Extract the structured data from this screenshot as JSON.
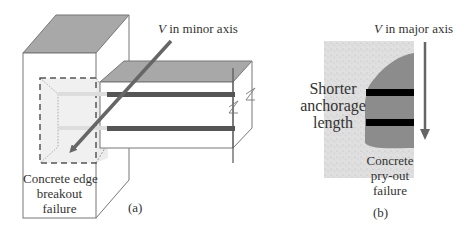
{
  "panel_a": {
    "axis_label_var": "V",
    "axis_label_rest": " in minor axis",
    "failure_label_lines": [
      "Concrete edge",
      "breakout",
      "failure"
    ],
    "caption": "(a)"
  },
  "panel_b": {
    "axis_label_var": "V",
    "axis_label_rest": " in major axis",
    "anchorage_label_lines": [
      "Shorter",
      "anchorage",
      "length"
    ],
    "failure_label_lines": [
      "Concrete",
      "pry-out",
      "failure"
    ],
    "caption": "(b)"
  },
  "colors": {
    "block_top": "#a8a8a8",
    "block_edge": "#666666",
    "rebar_dark": "#555555",
    "rebar_b": "#000000",
    "arrow": "#666666",
    "concrete_fill": "#dcdcdc",
    "failure_zone": "#8c8c8c",
    "breakout_fill": "#ececec"
  }
}
